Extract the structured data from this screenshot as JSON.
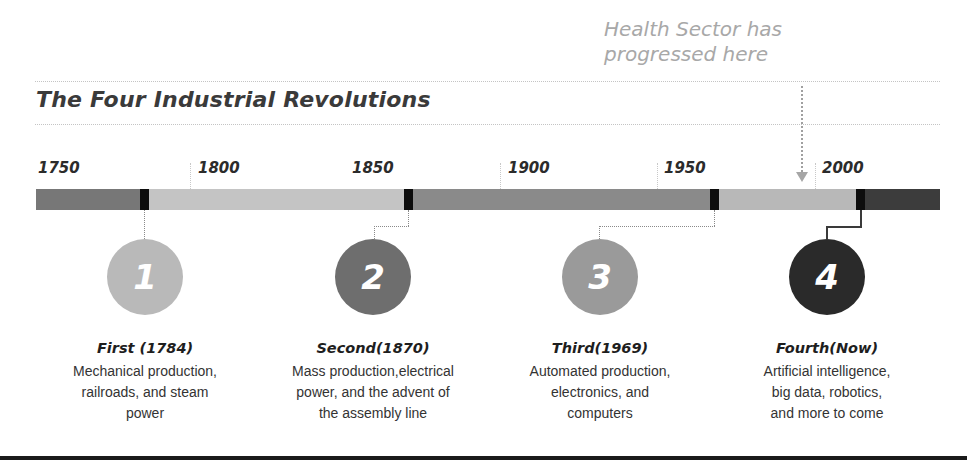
{
  "callout": {
    "line1": "Health Sector has",
    "line2": "progressed here",
    "color": "#a8a8a8"
  },
  "title": "The Four Industrial Revolutions",
  "timeline": {
    "years": [
      "1750",
      "1800",
      "1850",
      "1900",
      "1950",
      "2000"
    ],
    "segment_colors": {
      "first": "#777777",
      "second": "#c4c4c4",
      "third": "#8a8a8a",
      "fourth_pre": "#b8b8b8",
      "fourth": "#3c3c3c",
      "marker": "#0d0d0d"
    }
  },
  "stages": [
    {
      "number": "1",
      "heading": "First (1784)",
      "desc_lines": [
        "Mechanical production,",
        "railroads, and steam",
        "power"
      ],
      "circle_color": "#b9b9b9"
    },
    {
      "number": "2",
      "heading": "Second(1870)",
      "desc_lines": [
        "Mass production,electrical",
        "power, and the advent of",
        "the assembly line"
      ],
      "circle_color": "#6e6e6e"
    },
    {
      "number": "3",
      "heading": "Third(1969)",
      "desc_lines": [
        "Automated production,",
        "electronics, and",
        "computers"
      ],
      "circle_color": "#9a9a9a"
    },
    {
      "number": "4",
      "heading": "Fourth(Now)",
      "desc_lines": [
        "Artificial intelligence,",
        "big data, robotics,",
        "and more to come"
      ],
      "circle_color": "#2a2a2a"
    }
  ]
}
